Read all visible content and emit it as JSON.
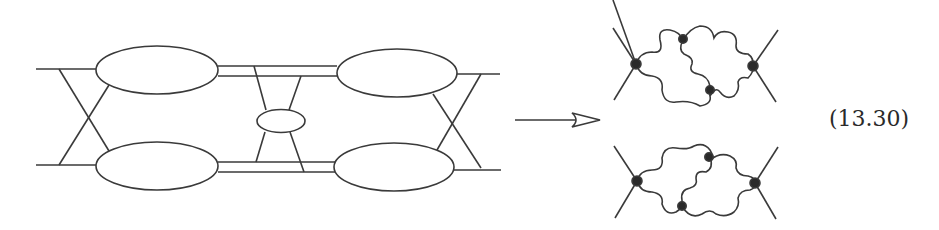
{
  "equation_label": "(13.30)",
  "colors": {
    "stroke": "#3a3a3a",
    "vertex": "#2a2a2a",
    "background": "#ffffff"
  },
  "left_diagram": {
    "description": "Four large blobs connected by double lines with crossed external legs and a central small blob",
    "blobs": [
      "top-left",
      "bottom-left",
      "top-right",
      "bottom-right",
      "center-small"
    ]
  },
  "arrow": {
    "direction": "right",
    "style": "open-head"
  },
  "right_diagrams": [
    {
      "name": "upper",
      "vertices": 4,
      "propagators": "wavy"
    },
    {
      "name": "lower",
      "vertices": 4,
      "propagators": "wavy"
    }
  ]
}
